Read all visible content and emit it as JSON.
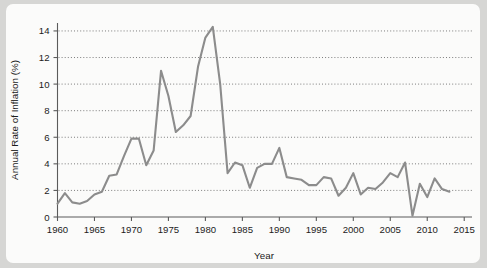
{
  "chart_data": {
    "type": "line",
    "title": "",
    "xlabel": "Year",
    "ylabel": "Annual Rate of Inflation (%)",
    "xlim": [
      1959,
      2016
    ],
    "ylim": [
      0,
      15
    ],
    "grid": true,
    "legend": false,
    "line_color": "#8c8c8c",
    "x_ticks": [
      1960,
      1965,
      1970,
      1975,
      1980,
      1985,
      1990,
      1995,
      2000,
      2005,
      2010,
      2015
    ],
    "y_ticks": [
      0,
      2,
      4,
      6,
      8,
      10,
      12,
      14
    ],
    "x": [
      1960,
      1961,
      1962,
      1963,
      1964,
      1965,
      1966,
      1967,
      1968,
      1969,
      1970,
      1971,
      1972,
      1973,
      1974,
      1975,
      1976,
      1977,
      1978,
      1979,
      1980,
      1981,
      1982,
      1983,
      1984,
      1985,
      1986,
      1987,
      1988,
      1989,
      1990,
      1991,
      1992,
      1993,
      1994,
      1995,
      1996,
      1997,
      1998,
      1999,
      2000,
      2001,
      2002,
      2003,
      2004,
      2005,
      2006,
      2007,
      2008,
      2009,
      2010,
      2011,
      2012,
      2013
    ],
    "values": [
      1.0,
      1.8,
      1.1,
      1.0,
      1.2,
      1.7,
      1.9,
      3.1,
      3.2,
      4.6,
      5.9,
      5.9,
      3.9,
      5.0,
      11.0,
      9.1,
      6.4,
      6.9,
      7.6,
      11.3,
      13.5,
      14.3,
      10.0,
      3.3,
      4.1,
      3.9,
      2.2,
      3.7,
      4.0,
      4.0,
      5.2,
      3.0,
      2.9,
      2.8,
      2.4,
      2.4,
      3.0,
      2.9,
      1.6,
      2.2,
      3.3,
      1.7,
      2.2,
      2.1,
      2.6,
      3.3,
      3.0,
      4.1,
      0.1,
      2.5,
      1.5,
      2.9,
      2.1,
      1.9
    ],
    "y_tick_labels": [
      "0",
      "2",
      "4",
      "6",
      "8",
      "10",
      "12",
      "14"
    ],
    "x_tick_labels": [
      "1960",
      "1965",
      "1970",
      "1975",
      "1980",
      "1985",
      "1990",
      "1995",
      "2000",
      "2005",
      "2010",
      "2015"
    ]
  }
}
